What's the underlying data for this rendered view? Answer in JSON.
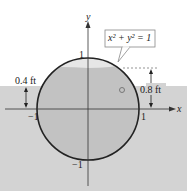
{
  "diagram": {
    "equation": "x² + y² = 1",
    "axis_x_label": "x",
    "axis_y_label": "y",
    "tick_x_pos": "1",
    "tick_x_neg": "−1",
    "tick_y_pos": "1",
    "tick_y_neg": "−1",
    "left_depth_label": "0.4 ft",
    "right_depth_label": "0.8 ft",
    "colors": {
      "water": "#d2d2d2",
      "inner": "#c0c0c0",
      "circle": "#222222"
    }
  }
}
